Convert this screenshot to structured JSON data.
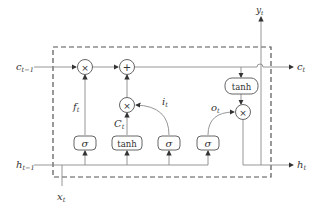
{
  "diagram": {
    "type": "LSTM cell",
    "inputs": {
      "c_prev": {
        "base": "c",
        "sub": "t−1"
      },
      "h_prev": {
        "base": "h",
        "sub": "t−1"
      },
      "x": {
        "base": "x",
        "sub": "t"
      }
    },
    "outputs": {
      "c": {
        "base": "c",
        "sub": "t"
      },
      "h": {
        "base": "h",
        "sub": "t"
      },
      "y": {
        "base": "y",
        "sub": "t"
      }
    },
    "operators": {
      "forget_mul": "×",
      "add": "+",
      "input_mul": "×",
      "output_mul": "×"
    },
    "gates": {
      "forget": {
        "fn": "σ",
        "out": {
          "base": "f",
          "sub": "t"
        }
      },
      "candidate": {
        "fn": "tanh",
        "out": {
          "base": "C",
          "sub": "t"
        }
      },
      "input": {
        "fn": "σ",
        "out": {
          "base": "i",
          "sub": "t"
        }
      },
      "output": {
        "fn": "σ",
        "out": {
          "base": "o",
          "sub": "t"
        }
      },
      "cell_tanh": {
        "fn": "tanh"
      }
    },
    "colors": {
      "line": "#8a8a8a",
      "dashed": "#555555",
      "text": "#333333"
    }
  }
}
